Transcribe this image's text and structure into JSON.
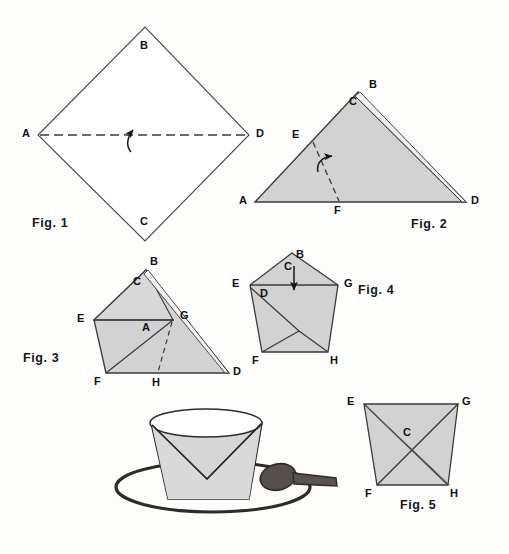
{
  "page": {
    "type": "instructional-origami-diagram",
    "background_color": "#fdfdfc",
    "width": 509,
    "height": 554
  },
  "style": {
    "paper_fill": "#ffffff",
    "shaded_fill": "#d2d2d2",
    "shaded_fill_light": "#dcdcdc",
    "line_color": "#3a3a3a",
    "ink_color": "#15161a",
    "spoon_color": "#4a4440"
  },
  "figures": [
    {
      "id": "fig1",
      "caption": "Fig. 1",
      "shape": "diamond",
      "description": "square sheet rotated 45 degrees, unshaded, with horizontal dashed valley fold from A to D and a curved fold arrow",
      "vertices": [
        {
          "label": "A",
          "x": 38,
          "y": 135,
          "lx": 22,
          "ly": 129
        },
        {
          "label": "B",
          "x": 145,
          "y": 27,
          "lx": 140,
          "ly": 40
        },
        {
          "label": "C",
          "x": 145,
          "y": 241,
          "lx": 140,
          "ly": 216
        },
        {
          "label": "D",
          "x": 249,
          "y": 135,
          "lx": 256,
          "ly": 129
        }
      ],
      "fold_line": {
        "from": "A",
        "to": "D",
        "style": "dashed"
      },
      "arrow": {
        "type": "fold-up-curved",
        "x": 134,
        "y": 135
      }
    },
    {
      "id": "fig2",
      "caption": "Fig. 2",
      "shape": "triangle",
      "description": "folded triangle, shaded, apex B with layer C, dashed fold line E to F with curved arrow pointing right",
      "vertices": [
        {
          "label": "A",
          "x": 255,
          "y": 202,
          "lx": 240,
          "ly": 196
        },
        {
          "label": "B",
          "x": 360,
          "y": 92,
          "lx": 370,
          "ly": 80
        },
        {
          "label": "C",
          "x": 352,
          "y": 100,
          "lx": 352,
          "ly": 99
        },
        {
          "label": "D",
          "x": 466,
          "y": 202,
          "lx": 472,
          "ly": 196
        },
        {
          "label": "E",
          "x": 313,
          "y": 142,
          "lx": 293,
          "ly": 130
        },
        {
          "label": "F",
          "x": 339,
          "y": 202,
          "lx": 334,
          "ly": 206
        }
      ],
      "fold_line": {
        "from": "E",
        "to": "F",
        "style": "dashed"
      },
      "arrow": {
        "type": "fold-right-curved",
        "x": 330,
        "y": 160
      }
    },
    {
      "id": "fig3",
      "caption": "Fig. 3",
      "shape": "kite-triangle",
      "description": "shaded triangle with horizontal crease E to G, point A folded to G, dashed fold line G to H",
      "vertices": [
        {
          "label": "A",
          "x": 148,
          "y": 322,
          "lx": 143,
          "ly": 320
        },
        {
          "label": "B",
          "x": 146,
          "y": 270,
          "lx": 150,
          "ly": 258
        },
        {
          "label": "C",
          "x": 138,
          "y": 280,
          "lx": 135,
          "ly": 280
        },
        {
          "label": "D",
          "x": 229,
          "y": 373,
          "lx": 234,
          "ly": 368
        },
        {
          "label": "E",
          "x": 94,
          "y": 320,
          "lx": 78,
          "ly": 314
        },
        {
          "label": "F",
          "x": 106,
          "y": 373,
          "lx": 96,
          "ly": 377
        },
        {
          "label": "G",
          "x": 173,
          "y": 320,
          "lx": 181,
          "ly": 312
        },
        {
          "label": "H",
          "x": 158,
          "y": 373,
          "lx": 153,
          "ly": 378
        }
      ],
      "fold_line": {
        "from": "G",
        "to": "H",
        "style": "dashed"
      }
    },
    {
      "id": "fig4",
      "caption": "Fig. 4",
      "shape": "pentagon",
      "description": "shaded pentagon, flap C pushed down as shown by straight down arrow, points E D G across the middle, F and H at the base",
      "vertices": [
        {
          "label": "B",
          "x": 292,
          "y": 253,
          "lx": 296,
          "ly": 250
        },
        {
          "label": "C",
          "x": 288,
          "y": 262,
          "lx": 285,
          "ly": 262
        },
        {
          "label": "D",
          "x": 262,
          "y": 292,
          "lx": 261,
          "ly": 290
        },
        {
          "label": "E",
          "x": 250,
          "y": 285,
          "lx": 233,
          "ly": 279
        },
        {
          "label": "F",
          "x": 262,
          "y": 352,
          "lx": 253,
          "ly": 356
        },
        {
          "label": "G",
          "x": 338,
          "y": 285,
          "lx": 345,
          "ly": 279
        },
        {
          "label": "H",
          "x": 328,
          "y": 352,
          "lx": 331,
          "ly": 356
        }
      ],
      "arrow": {
        "type": "push-down-straight",
        "x": 294,
        "y": 268,
        "to_y": 292
      }
    },
    {
      "id": "fig5",
      "caption": "Fig. 5",
      "shape": "trapezoid",
      "description": "finished shaded cup, trapezoid with crossing creases from E to H and G to F, point C at center",
      "vertices": [
        {
          "label": "C",
          "x": 408,
          "y": 432,
          "lx": 404,
          "ly": 430
        },
        {
          "label": "E",
          "x": 364,
          "y": 404,
          "lx": 348,
          "ly": 397
        },
        {
          "label": "F",
          "x": 377,
          "y": 485,
          "lx": 366,
          "ly": 489
        },
        {
          "label": "G",
          "x": 458,
          "y": 404,
          "lx": 463,
          "ly": 397
        },
        {
          "label": "H",
          "x": 448,
          "y": 485,
          "lx": 451,
          "ly": 489
        }
      ]
    }
  ],
  "illustration": {
    "id": "finished-cup",
    "description": "pictorial drawing of the finished paper cup standing on a saucer with a spoon beside it",
    "parts": [
      "cup",
      "saucer",
      "spoon"
    ]
  },
  "captions": [
    {
      "text": "Fig. 1",
      "x": 32,
      "y": 222
    },
    {
      "text": "Fig. 2",
      "x": 411,
      "y": 223
    },
    {
      "text": "Fig. 3",
      "x": 23,
      "y": 357
    },
    {
      "text": "Fig. 4",
      "x": 358,
      "y": 289
    },
    {
      "text": "Fig. 5",
      "x": 400,
      "y": 504
    }
  ]
}
